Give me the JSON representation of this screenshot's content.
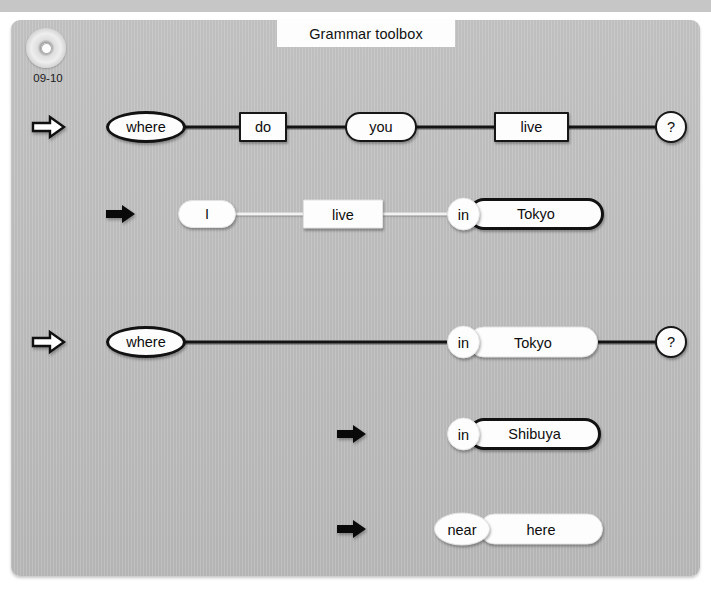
{
  "page": {
    "clipped_top_caption": "ここに書いてみましょう！",
    "title": "Grammar toolbox",
    "disc_icon": "cd-disc-icon",
    "disc_label": "09-10",
    "background_color": "#bfbfbf",
    "panel_color": "#b9b9b9",
    "node_fill": "#fdfdfd",
    "ink_color": "#121212"
  },
  "rows": [
    {
      "id": "row-question-1",
      "arrow": {
        "name": "outline-arrow-icon",
        "style": "outline"
      },
      "nodes": [
        {
          "text": "where",
          "shape": "ellipse",
          "border": "bold"
        },
        {
          "text": "do",
          "shape": "rect",
          "border": "medium"
        },
        {
          "text": "you",
          "shape": "pill",
          "border": "medium"
        },
        {
          "text": "live",
          "shape": "rect",
          "border": "medium"
        },
        {
          "text": "?",
          "shape": "circle",
          "border": "medium"
        }
      ]
    },
    {
      "id": "row-answer-1",
      "arrow": {
        "name": "solid-arrow-icon",
        "style": "solid"
      },
      "nodes": [
        {
          "text": "I",
          "shape": "pill",
          "border": "light"
        },
        {
          "text": "live",
          "shape": "rect",
          "border": "light"
        },
        {
          "text": "in",
          "shape": "circle",
          "border": "light"
        },
        {
          "text": "Tokyo",
          "shape": "pill",
          "border": "bold"
        }
      ]
    },
    {
      "id": "row-question-2",
      "arrow": {
        "name": "outline-arrow-icon",
        "style": "outline"
      },
      "nodes": [
        {
          "text": "where",
          "shape": "ellipse",
          "border": "bold"
        },
        {
          "text": "in",
          "shape": "circle",
          "border": "light"
        },
        {
          "text": "Tokyo",
          "shape": "pill",
          "border": "light"
        },
        {
          "text": "?",
          "shape": "circle",
          "border": "medium"
        }
      ]
    },
    {
      "id": "row-answer-2",
      "arrow": {
        "name": "solid-arrow-icon",
        "style": "solid"
      },
      "nodes": [
        {
          "text": "in",
          "shape": "circle",
          "border": "light"
        },
        {
          "text": "Shibuya",
          "shape": "pill",
          "border": "bold"
        }
      ]
    },
    {
      "id": "row-answer-3",
      "arrow": {
        "name": "solid-arrow-icon",
        "style": "solid"
      },
      "nodes": [
        {
          "text": "near",
          "shape": "ellipse",
          "border": "light"
        },
        {
          "text": "here",
          "shape": "pill",
          "border": "light"
        }
      ]
    }
  ]
}
